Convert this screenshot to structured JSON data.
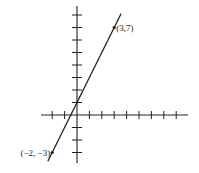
{
  "chart_data": {
    "type": "line",
    "title": "",
    "xlabel": "",
    "ylabel": "",
    "grid": false,
    "x_ticks": [
      -2,
      -1,
      1,
      2,
      3,
      4,
      5,
      6,
      7,
      8
    ],
    "y_ticks": [
      -3,
      -2,
      -1,
      1,
      2,
      3,
      4,
      5,
      6,
      7,
      8
    ],
    "xlim": [
      -3,
      9
    ],
    "ylim": [
      -4,
      8.5
    ],
    "series": [
      {
        "name": "line",
        "x": [
          -2,
          3
        ],
        "y": [
          -3,
          7
        ],
        "equation": "y = 2x + 1"
      }
    ],
    "points": [
      {
        "x": 3,
        "y": 7,
        "label": "(3,7)"
      },
      {
        "x": -2,
        "y": -3,
        "label": "(−2, −3)"
      }
    ]
  },
  "labels": {
    "point_a": "(3,7)",
    "point_b": "(−2, −3)"
  },
  "colors": {
    "ink": "#222222",
    "background": "#ffffff"
  }
}
